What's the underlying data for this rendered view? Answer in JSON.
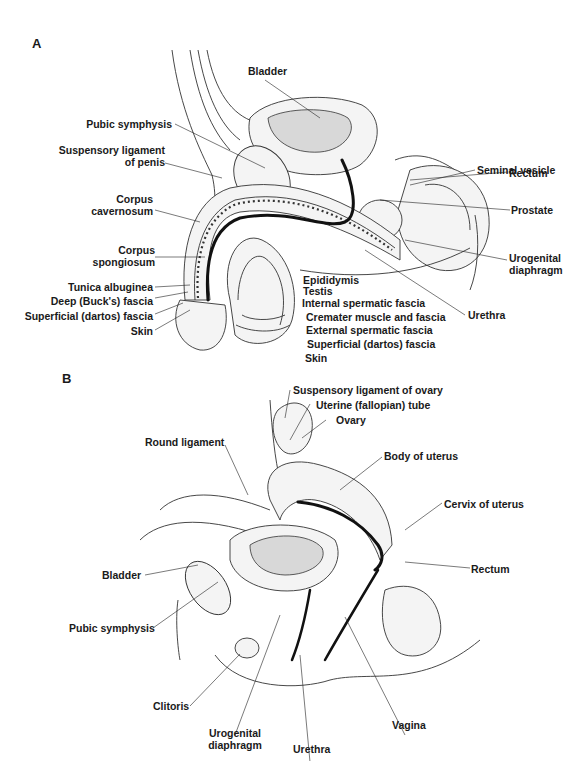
{
  "figure": {
    "panels": [
      {
        "letter": "A",
        "subject": "male pelvis sagittal section",
        "labels": {
          "bladder": "Bladder",
          "pubic_symphysis": "Pubic symphysis",
          "suspensory_ligament_l1": "Suspensory ligament",
          "suspensory_ligament_l2": "of penis",
          "corpus_cavernosum_l1": "Corpus",
          "corpus_cavernosum_l2": "cavernosum",
          "corpus_spongiosum_l1": "Corpus",
          "corpus_spongiosum_l2": "spongiosum",
          "tunica_albuginea": "Tunica albuginea",
          "deep_fascia": "Deep (Buck's) fascia",
          "superficial_fascia_left": "Superficial (dartos) fascia",
          "skin_left": "Skin",
          "seminal_vesicle": "Seminal vesicle",
          "rectum": "Rectum",
          "prostate": "Prostate",
          "urogenital_diaphragm_l1": "Urogenital",
          "urogenital_diaphragm_l2": "diaphragm",
          "urethra": "Urethra",
          "epididymis": "Epididymis",
          "testis": "Testis",
          "internal_spermatic_fascia": "Internal spermatic fascia",
          "cremater": "Cremater muscle and fascia",
          "external_spermatic_fascia": "External spermatic fascia",
          "superficial_fascia_right": "Superficial (dartos) fascia",
          "skin_right": "Skin"
        }
      },
      {
        "letter": "B",
        "subject": "female pelvis sagittal section",
        "labels": {
          "suspensory_ligament_ovary": "Suspensory ligament of ovary",
          "uterine_tube": "Uterine (fallopian) tube",
          "ovary": "Ovary",
          "round_ligament": "Round ligament",
          "body_of_uterus": "Body of uterus",
          "cervix": "Cervix of uterus",
          "bladder": "Bladder",
          "rectum": "Rectum",
          "pubic_symphysis": "Pubic symphysis",
          "clitoris": "Clitoris",
          "urogenital_diaphragm_l1": "Urogenital",
          "urogenital_diaphragm_l2": "diaphragm",
          "urethra": "Urethra",
          "vagina": "Vagina"
        }
      }
    ]
  }
}
